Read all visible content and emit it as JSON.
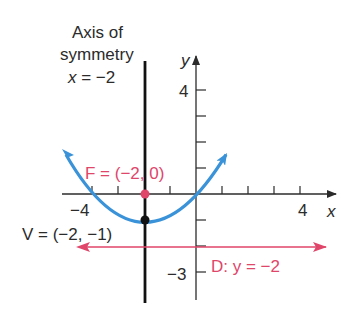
{
  "diagram": {
    "axis_of_symmetry": {
      "line1": "Axis of",
      "line2": "symmetry",
      "eq_var": "x",
      "eq_rest": " = −2"
    },
    "axes": {
      "x_label": "x",
      "y_label": "y"
    },
    "tick_labels": {
      "x_neg4": "−4",
      "x_pos4": "4",
      "y_pos4": "4",
      "y_neg3": "−3"
    },
    "focus": {
      "label": "F = (−2, 0)",
      "x": -2,
      "y": 0
    },
    "vertex": {
      "label": "V = (−2, −1)",
      "x": -2,
      "y": -1
    },
    "directrix": {
      "label": "D: y = −2",
      "y": -2
    },
    "colors": {
      "parabola": "#3a93d8",
      "focus_directrix": "#e0456a",
      "axis": "#2b2b2b",
      "symmetry_line": "#111111"
    }
  }
}
